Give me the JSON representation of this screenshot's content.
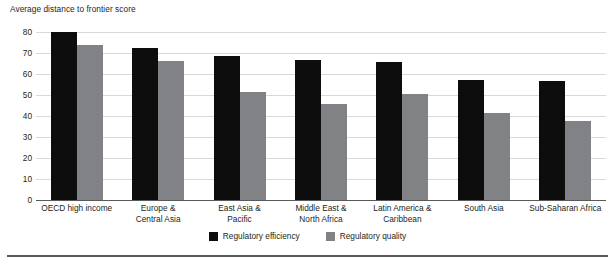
{
  "chart_data": {
    "type": "bar",
    "title": "",
    "ylabel": "Average distance to frontier score",
    "xlabel": "",
    "ylim": [
      0,
      80
    ],
    "yticks": [
      0,
      10,
      20,
      30,
      40,
      50,
      60,
      70,
      80
    ],
    "grid": true,
    "legend_position": "bottom-center",
    "categories": [
      "OECD high income",
      "Europe &\nCentral Asia",
      "East Asia &\nPacific",
      "Middle East &\nNorth Africa",
      "Latin America &\nCaribbean",
      "South Asia",
      "Sub-Saharan Africa"
    ],
    "category_lines": [
      [
        "OECD high income"
      ],
      [
        "Europe &",
        "Central Asia"
      ],
      [
        "East Asia &",
        "Pacific"
      ],
      [
        "Middle East &",
        "North Africa"
      ],
      [
        "Latin America &",
        "Caribbean"
      ],
      [
        "South Asia"
      ],
      [
        "Sub-Saharan Africa"
      ]
    ],
    "series": [
      {
        "name": "Regulatory efficiency",
        "color": "#0d0d0d",
        "values": [
          79.8,
          72.6,
          68.6,
          66.5,
          65.5,
          57.0,
          56.6
        ]
      },
      {
        "name": "Regulatory quality",
        "color": "#808285",
        "values": [
          73.8,
          66.0,
          51.3,
          45.8,
          50.3,
          41.5,
          37.5
        ]
      }
    ]
  },
  "legend": {
    "items": [
      {
        "label": "Regulatory efficiency",
        "color": "#0d0d0d",
        "swatch": "legend-swatch-black"
      },
      {
        "label": "Regulatory quality",
        "color": "#808285",
        "swatch": "legend-swatch-gray"
      }
    ]
  },
  "colors": {
    "efficiency": "#0d0d0d",
    "quality": "#808285",
    "gridline": "#d9d9d9",
    "axis": "#58595b",
    "text": "#231f20",
    "background": "#ffffff"
  }
}
